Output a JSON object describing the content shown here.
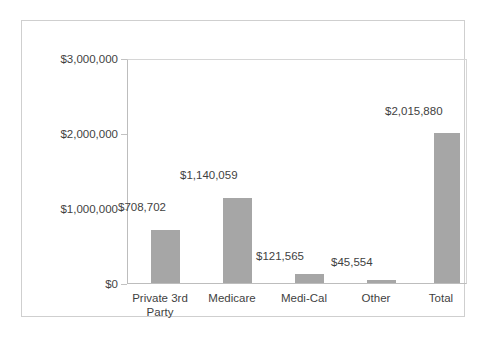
{
  "chart_data": {
    "type": "bar",
    "title": "",
    "subtitle": "",
    "xlabel": "",
    "ylabel": "",
    "categories": [
      "Private 3rd Party",
      "Medicare",
      "Medi-Cal",
      "Other",
      "Total"
    ],
    "category_display": [
      "Private 3rd\nParty",
      "Medicare",
      "Medi-Cal",
      "Other",
      "Total"
    ],
    "values": [
      708702,
      1140059,
      121565,
      45554,
      2015880
    ],
    "data_labels": [
      "$708,702",
      "$1,140,059",
      "$121,565",
      "$45,554",
      "$2,015,880"
    ],
    "ylim": [
      0,
      3000000
    ],
    "ytick_values": [
      0,
      1000000,
      2000000,
      3000000
    ],
    "ytick_labels": [
      "$0",
      "$1,000,000",
      "$2,000,000",
      "$3,000,000"
    ],
    "grid": false,
    "legend": null,
    "bar_color": "#a6a6a6",
    "plot_border_color": "#bdbdbd",
    "frame_border_color": "#cfcfcf",
    "background_color": "#ffffff",
    "text_color": "#3f3f3f"
  }
}
